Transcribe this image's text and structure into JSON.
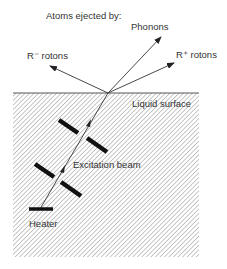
{
  "diagram": {
    "title": "Atoms ejected by:",
    "labels": {
      "phonons": "Phonons",
      "r_minus": "R⁻ rotons",
      "r_plus": "R⁺ rotons",
      "surface": "Liquid surface",
      "beam": "Excitation beam",
      "heater": "Heater"
    },
    "colors": {
      "line": "#333333",
      "bar": "#111111",
      "hatch": "#9a9a9a",
      "background": "#ffffff"
    }
  }
}
